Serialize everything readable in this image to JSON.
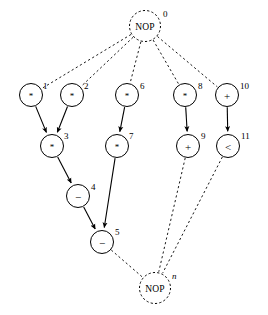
{
  "diagram": {
    "type": "directed-acyclic-graph",
    "title": "",
    "background_color": "#ffffff",
    "stroke_color": "#000000",
    "nodes": [
      {
        "id": "nop0",
        "label": "0",
        "label_style": "roman",
        "op": "NOP",
        "shape": "circle",
        "border": "dashed",
        "cx": 145,
        "cy": 26,
        "r": 15.5,
        "label_x": 163,
        "label_y": 14
      },
      {
        "id": "n1",
        "label": "1",
        "label_style": "roman",
        "op": "*",
        "shape": "circle",
        "border": "solid",
        "cx": 31,
        "cy": 95,
        "r": 11.5,
        "label_x": 43,
        "label_y": 86
      },
      {
        "id": "n2",
        "label": "2",
        "label_style": "roman",
        "op": "*",
        "shape": "circle",
        "border": "solid",
        "cx": 72,
        "cy": 95,
        "r": 11.5,
        "label_x": 84,
        "label_y": 86
      },
      {
        "id": "n6",
        "label": "6",
        "label_style": "roman",
        "op": "*",
        "shape": "circle",
        "border": "solid",
        "cx": 127,
        "cy": 95,
        "r": 11.5,
        "label_x": 140,
        "label_y": 86
      },
      {
        "id": "n8",
        "label": "8",
        "label_style": "roman",
        "op": "*",
        "shape": "circle",
        "border": "solid",
        "cx": 185,
        "cy": 95,
        "r": 11.5,
        "label_x": 198,
        "label_y": 86
      },
      {
        "id": "n10",
        "label": "10",
        "label_style": "roman",
        "op": "+",
        "shape": "circle",
        "border": "solid",
        "cx": 227,
        "cy": 95,
        "r": 11.5,
        "label_x": 240,
        "label_y": 86
      },
      {
        "id": "n3",
        "label": "3",
        "label_style": "roman",
        "op": "*",
        "shape": "circle",
        "border": "solid",
        "cx": 52,
        "cy": 146,
        "r": 11.5,
        "label_x": 64,
        "label_y": 136
      },
      {
        "id": "n7",
        "label": "7",
        "label_style": "roman",
        "op": "*",
        "shape": "circle",
        "border": "solid",
        "cx": 117,
        "cy": 146,
        "r": 11.5,
        "label_x": 129,
        "label_y": 136
      },
      {
        "id": "n9",
        "label": "9",
        "label_style": "roman",
        "op": "+",
        "shape": "circle",
        "border": "solid",
        "cx": 188,
        "cy": 146,
        "r": 11.5,
        "label_x": 201,
        "label_y": 136
      },
      {
        "id": "n11",
        "label": "11",
        "label_style": "roman",
        "op": "<",
        "shape": "circle",
        "border": "solid",
        "cx": 228,
        "cy": 146,
        "r": 11.5,
        "label_x": 241,
        "label_y": 136
      },
      {
        "id": "n4",
        "label": "4",
        "label_style": "roman",
        "op": "−",
        "shape": "circle",
        "border": "solid",
        "cx": 78,
        "cy": 196,
        "r": 11.5,
        "label_x": 91,
        "label_y": 187
      },
      {
        "id": "n5",
        "label": "5",
        "label_style": "roman",
        "op": "−",
        "shape": "circle",
        "border": "solid",
        "cx": 102,
        "cy": 242,
        "r": 11.5,
        "label_x": 115,
        "label_y": 232
      },
      {
        "id": "nopn",
        "label": "n",
        "label_style": "italic",
        "op": "NOP",
        "shape": "circle",
        "border": "dashed",
        "cx": 155,
        "cy": 288,
        "r": 15.5,
        "label_x": 172,
        "label_y": 276
      }
    ],
    "edges": [
      {
        "from": "nop0",
        "to": "n1",
        "style": "dashed",
        "arrow": false
      },
      {
        "from": "nop0",
        "to": "n2",
        "style": "dashed",
        "arrow": false
      },
      {
        "from": "nop0",
        "to": "n6",
        "style": "dashed",
        "arrow": false
      },
      {
        "from": "nop0",
        "to": "n8",
        "style": "dashed",
        "arrow": false
      },
      {
        "from": "nop0",
        "to": "n10",
        "style": "dashed",
        "arrow": false
      },
      {
        "from": "n1",
        "to": "n3",
        "style": "solid",
        "arrow": true
      },
      {
        "from": "n2",
        "to": "n3",
        "style": "solid",
        "arrow": true
      },
      {
        "from": "n6",
        "to": "n7",
        "style": "solid",
        "arrow": true
      },
      {
        "from": "n8",
        "to": "n9",
        "style": "solid",
        "arrow": true
      },
      {
        "from": "n10",
        "to": "n11",
        "style": "solid",
        "arrow": true
      },
      {
        "from": "n3",
        "to": "n4",
        "style": "solid",
        "arrow": true
      },
      {
        "from": "n4",
        "to": "n5",
        "style": "solid",
        "arrow": true
      },
      {
        "from": "n7",
        "to": "n5",
        "style": "solid",
        "arrow": true
      },
      {
        "from": "n5",
        "to": "nopn",
        "style": "dashed",
        "arrow": false
      },
      {
        "from": "n9",
        "to": "nopn",
        "style": "dashed",
        "arrow": false
      },
      {
        "from": "n11",
        "to": "nopn",
        "style": "dashed",
        "arrow": false
      }
    ]
  }
}
